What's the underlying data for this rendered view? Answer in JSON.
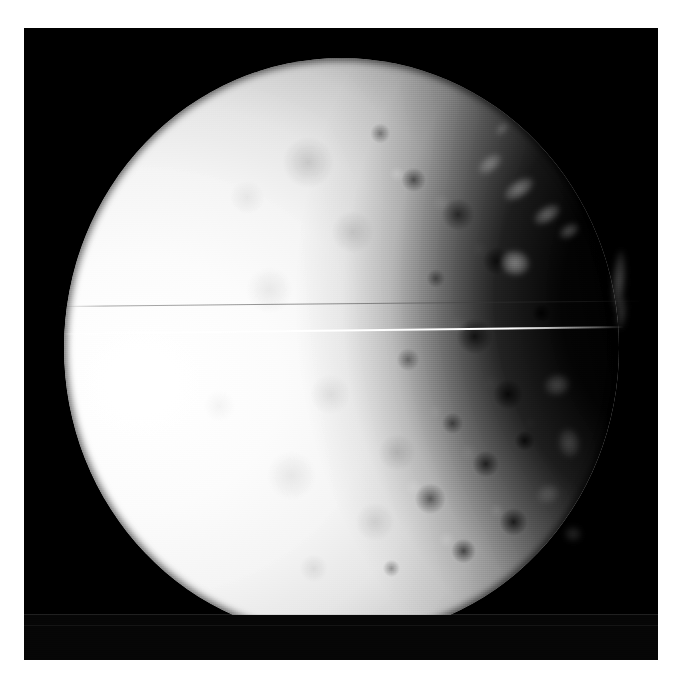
{
  "page": {
    "background_color": "#ffffff",
    "width": 675,
    "height": 681
  },
  "image": {
    "kind": "spacecraft-photograph",
    "subject": "cratered icy moon",
    "description": "Grayscale spacecraft image of a heavily cratered icy moon, lit from the left, with the terminator crossing the right portion of the disc.",
    "frame": {
      "background_color": "#000000",
      "left": 24,
      "top": 28,
      "width": 634,
      "height": 632
    },
    "moon": {
      "limb_color": "#fbfbfb",
      "shadow_color": "#000000",
      "terminator_side": "right",
      "illumination_direction": "from left",
      "disc": {
        "left": 40,
        "top": 30,
        "width": 555,
        "height": 580
      }
    },
    "artifacts": {
      "bright_scanline": {
        "label": "bright horizontal scan-line artifact",
        "color": "#ffffff",
        "top": 305,
        "tilt_degrees": -0.72
      },
      "dark_scanline": {
        "label": "faint dark horizontal scan-line artifact",
        "color": "#3c3c3c",
        "top": 278,
        "tilt_degrees": -0.55
      },
      "plate_seam": {
        "label": "horizontal frame seam near bottom of plate",
        "color": "#969696",
        "top": 586
      }
    },
    "night_side_glints": [
      {
        "name": "glint-upper-ridge",
        "left": 452,
        "top": 128,
        "width": 28,
        "height": 16,
        "brightness": 0.33,
        "rotation": -38
      },
      {
        "name": "glint-crater-rim-a",
        "left": 478,
        "top": 152,
        "width": 34,
        "height": 18,
        "brightness": 0.4,
        "rotation": -34
      },
      {
        "name": "glint-crater-rim-b",
        "left": 508,
        "top": 178,
        "width": 30,
        "height": 17,
        "brightness": 0.36,
        "rotation": -32
      },
      {
        "name": "glint-crater-rim-c",
        "left": 534,
        "top": 196,
        "width": 22,
        "height": 14,
        "brightness": 0.28,
        "rotation": -30
      },
      {
        "name": "glint-central-peak",
        "left": 476,
        "top": 222,
        "width": 30,
        "height": 26,
        "brightness": 0.46,
        "rotation": 10
      },
      {
        "name": "glint-east-ridge",
        "left": 588,
        "top": 222,
        "width": 14,
        "height": 62,
        "brightness": 0.26,
        "rotation": 4
      },
      {
        "name": "glint-east-ridge-2",
        "left": 592,
        "top": 268,
        "width": 11,
        "height": 34,
        "brightness": 0.18,
        "rotation": 6
      },
      {
        "name": "glint-lower-knob",
        "left": 520,
        "top": 346,
        "width": 26,
        "height": 22,
        "brightness": 0.22,
        "rotation": -12
      },
      {
        "name": "glint-lower-rim",
        "left": 534,
        "top": 400,
        "width": 22,
        "height": 30,
        "brightness": 0.2,
        "rotation": -8
      },
      {
        "name": "glint-se-scarp",
        "left": 512,
        "top": 456,
        "width": 24,
        "height": 20,
        "brightness": 0.16,
        "rotation": -20
      },
      {
        "name": "glint-se-spot",
        "left": 540,
        "top": 498,
        "width": 18,
        "height": 16,
        "brightness": 0.14,
        "rotation": 0
      },
      {
        "name": "glint-top-fleck",
        "left": 470,
        "top": 96,
        "width": 16,
        "height": 10,
        "brightness": 0.22,
        "rotation": -45
      }
    ]
  }
}
